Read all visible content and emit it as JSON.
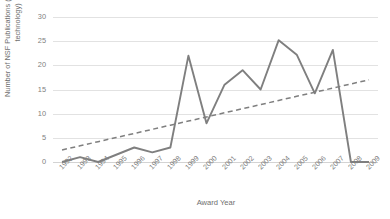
{
  "chart_data": {
    "type": "line",
    "title": "",
    "xlabel": "Award Year",
    "ylabel": "Number of NSF Publications (commercialized technology)",
    "ylabel_line1": "Number of NSF Publications",
    "ylabel_line2": "(commercialized technology)",
    "categories": [
      "1992",
      "1993",
      "1994",
      "1995",
      "1996",
      "1997",
      "1998",
      "1999",
      "2000",
      "2001",
      "2002",
      "2003",
      "2004",
      "2005",
      "2006",
      "2007",
      "2008",
      "2009"
    ],
    "yticks": [
      0,
      5,
      10,
      15,
      20,
      25,
      30
    ],
    "ylim": [
      0,
      30
    ],
    "grid": true,
    "legend": "none",
    "series": [
      {
        "name": "Number of NSF Publications (commercialized technology)",
        "style": "solid",
        "color": "#7f7f7f",
        "values": [
          0,
          1,
          0,
          1.5,
          3,
          2,
          3,
          22,
          8,
          16,
          19,
          15,
          25.2,
          22.2,
          14.2,
          23.2,
          0,
          0
        ]
      },
      {
        "name": "Linear trendline",
        "style": "dashed",
        "color": "#7f7f7f",
        "values": [
          2.5,
          3.35,
          4.21,
          5.06,
          5.91,
          6.76,
          7.62,
          8.47,
          9.32,
          10.18,
          11.03,
          11.88,
          12.74,
          13.59,
          14.44,
          15.29,
          16.15,
          17.0
        ]
      }
    ]
  },
  "colors": {
    "series_line": "#7f7f7f",
    "trendline": "#7f7f7f",
    "gridline": "#e2e2e2",
    "axis_text": "#808080",
    "title_text": "#6f6f6f",
    "background": "#ffffff"
  }
}
